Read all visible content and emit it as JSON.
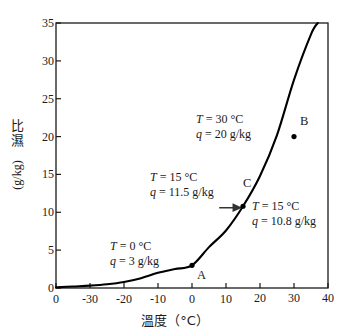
{
  "chart_data": {
    "type": "line",
    "title": "",
    "xlabel": "溫度（°C）",
    "ylabel_cjk": "比濕",
    "ylabel_unit": "(g/kg)",
    "xlim": [
      -40,
      40
    ],
    "ylim": [
      0,
      35
    ],
    "grid": false,
    "legend": "none",
    "xticks": [
      -40,
      -30,
      -20,
      -10,
      0,
      10,
      20,
      30,
      40
    ],
    "xtick_labels": [
      "0",
      "-30",
      "-20",
      "-10",
      "0",
      "10",
      "20",
      "30",
      "40"
    ],
    "yticks": [
      0,
      5,
      10,
      15,
      20,
      25,
      30,
      35
    ],
    "ytick_labels": [
      "0",
      "5",
      "10",
      "15",
      "20",
      "25",
      "30",
      "35"
    ],
    "series": [
      {
        "name": "飽和比濕曲線",
        "x": [
          -40,
          -35,
          -30,
          -25,
          -20,
          -15,
          -10,
          -5,
          0,
          5,
          10,
          15,
          20,
          25,
          30,
          35,
          37
        ],
        "y": [
          0.08,
          0.2,
          0.32,
          0.5,
          0.8,
          1.3,
          2.0,
          2.5,
          3.0,
          5.4,
          7.6,
          10.8,
          14.8,
          20.2,
          27.5,
          33.5,
          35.0
        ]
      }
    ],
    "points": [
      {
        "id": "A",
        "x": 0,
        "y": 3.0,
        "label": "A"
      },
      {
        "id": "B",
        "x": 30,
        "y": 20.0,
        "label": "B"
      },
      {
        "id": "C",
        "x": 15,
        "y": 10.8,
        "label": "C"
      }
    ],
    "annotations": [
      {
        "id": "annot-b",
        "line1_var": "T",
        "line1_eq": "= 30 °C",
        "line2_var": "q",
        "line2_eq": "= 20 g/kg"
      },
      {
        "id": "annot-c-left",
        "line1_var": "T",
        "line1_eq": "= 15 °C",
        "line2_var": "q",
        "line2_eq": "= 11.5 g/kg"
      },
      {
        "id": "annot-c-right",
        "line1_var": "T",
        "line1_eq": "= 15 °C",
        "line2_var": "q",
        "line2_eq": "= 10.8 g/kg"
      },
      {
        "id": "annot-a",
        "line1_var": "T",
        "line1_eq": "= 0 °C",
        "line2_var": "q",
        "line2_eq": "= 3 g/kg"
      }
    ],
    "arrow": {
      "from_x": 8.0,
      "to_x": 14.2,
      "y": 10.6
    },
    "colors": {
      "axis": "#1a1a1a",
      "curve": "#000000",
      "marker": "#000000",
      "text": "#1a1a1a"
    }
  }
}
